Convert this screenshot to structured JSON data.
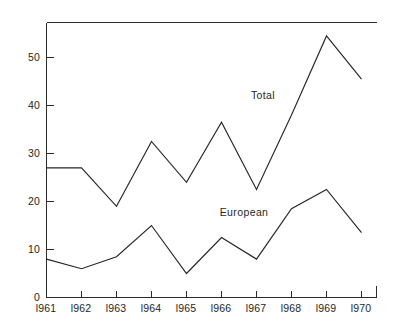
{
  "chart_data": {
    "type": "line",
    "title": "",
    "subtitle": "",
    "xlabel": "",
    "ylabel": "",
    "categories": [
      "1961",
      "1962",
      "1963",
      "1964",
      "1965",
      "1966",
      "1967",
      "1968",
      "1969",
      "1970"
    ],
    "x_tick_labels": [
      "l961",
      "l962",
      "l963",
      "l964",
      "l965",
      "l966",
      "l967",
      "l968",
      "l969",
      "l970"
    ],
    "y_tick_labels": [
      "0",
      "10",
      "20",
      "30",
      "40",
      "50"
    ],
    "y_ticks": [
      0,
      10,
      20,
      30,
      40,
      50
    ],
    "ylim": [
      0,
      57
    ],
    "xlim": [
      "1961",
      "1970"
    ],
    "grid": false,
    "legend_position": "inline-annotation",
    "series": [
      {
        "name": "Total",
        "label_text": "Total",
        "color": "#262626",
        "values": [
          27,
          27,
          19,
          32.5,
          24,
          36.5,
          22.5,
          38,
          54.5,
          45.5
        ]
      },
      {
        "name": "European",
        "label_text": "European",
        "color": "#262626",
        "values": [
          8,
          6,
          8.5,
          15,
          5,
          12.5,
          8,
          18.5,
          22.5,
          13.5
        ]
      }
    ],
    "annotations": [
      {
        "text": "Total",
        "series": "Total",
        "x": 263,
        "y": 99
      },
      {
        "text": "European",
        "series": "European",
        "x": 244,
        "y": 216
      }
    ]
  },
  "axes": {
    "y_axis_name": "value-axis",
    "x_axis_name": "year-axis"
  }
}
